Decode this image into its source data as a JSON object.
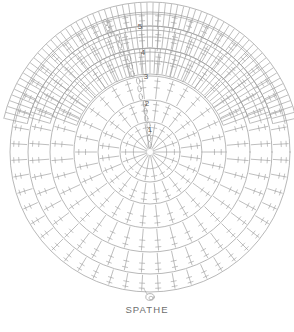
{
  "figure": {
    "caption": "SPATHE",
    "kind": "crochet-round-chart",
    "background_color": "#ffffff",
    "line_color": "#9a9a9a",
    "text_color": "#6e6e6e",
    "center_x": 150,
    "center_y": 152
  },
  "round_labels": [
    {
      "id": "1",
      "label": "1",
      "x": 150,
      "y": 132
    },
    {
      "id": "2",
      "label": "2",
      "x": 147,
      "y": 106
    },
    {
      "id": "3",
      "label": "3",
      "x": 146,
      "y": 79
    },
    {
      "id": "4",
      "label": "4",
      "x": 143,
      "y": 55
    },
    {
      "id": "5",
      "label": "5",
      "x": 140,
      "y": 29
    }
  ],
  "chart_data": {
    "type": "diagram",
    "title": "SPATHE",
    "rings": [
      {
        "index": 1,
        "radius": 30,
        "stitches": 18,
        "symbol": "double-crochet"
      },
      {
        "index": 2,
        "radius": 52,
        "stitches": 24,
        "symbol": "double-crochet"
      },
      {
        "index": 3,
        "radius": 76,
        "stitches": 30,
        "symbol": "double-crochet"
      },
      {
        "index": 4,
        "radius": 100,
        "stitches": 36,
        "symbol": "double-crochet"
      },
      {
        "index": 5,
        "radius": 122,
        "stitches": 44,
        "symbol": "double-crochet"
      },
      {
        "index": 6,
        "radius": 140,
        "stitches": 52,
        "symbol": "double-crochet"
      }
    ],
    "lower_bands": [
      {
        "index": 7,
        "inner_radius": 78,
        "outer_radius": 104,
        "arc_start_deg": 200,
        "arc_end_deg": 340
      },
      {
        "index": 8,
        "inner_radius": 104,
        "outer_radius": 126,
        "arc_start_deg": 196,
        "arc_end_deg": 344
      },
      {
        "index": 9,
        "inner_radius": 126,
        "outer_radius": 150,
        "arc_start_deg": 193,
        "arc_end_deg": 347
      }
    ],
    "start_loop": {
      "x": 150,
      "y": 297,
      "label": "starting-loop"
    }
  }
}
